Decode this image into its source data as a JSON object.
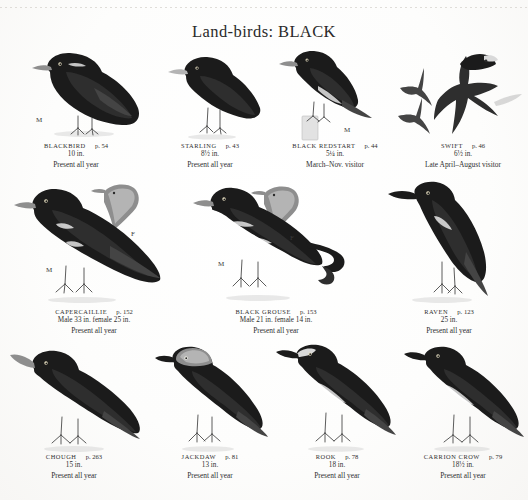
{
  "plate": {
    "title": "Land-birds: BLACK"
  },
  "rows": [
    {
      "entries": [
        {
          "name": "BLACKBIRD",
          "page": "p. 54",
          "size": "10 in.",
          "status": "Present all year",
          "icon": "blackbird-illustration",
          "sex_labels": [
            "M"
          ]
        },
        {
          "name": "STARLING",
          "page": "p. 43",
          "size": "8½ in.",
          "status": "Present all year",
          "icon": "starling-illustration",
          "sex_labels": []
        },
        {
          "name": "BLACK REDSTART",
          "page": "p. 44",
          "size": "5¼ in.",
          "status": "March–Nov. visitor",
          "icon": "black-redstart-illustration",
          "sex_labels": [
            "M"
          ]
        },
        {
          "name": "SWIFT",
          "page": "p. 46",
          "size": "6½ in.",
          "status": "Late April–August visitor",
          "icon": "swift-illustration",
          "sex_labels": []
        }
      ]
    },
    {
      "entries": [
        {
          "name": "CAPERCAILLIE",
          "page": "p. 152",
          "size": "Male 33 in. female 25 in.",
          "status": "Present all year",
          "icon": "capercaillie-illustration",
          "sex_labels": [
            "M",
            "F"
          ]
        },
        {
          "name": "BLACK GROUSE",
          "page": "p. 153",
          "size": "Male 21 in. female 14 in.",
          "status": "Present all year",
          "icon": "black-grouse-illustration",
          "sex_labels": [
            "M",
            "F"
          ]
        },
        {
          "name": "RAVEN",
          "page": "p. 123",
          "size": "25 in.",
          "status": "Present all year",
          "icon": "raven-illustration",
          "sex_labels": []
        }
      ]
    },
    {
      "entries": [
        {
          "name": "CHOUGH",
          "page": "p. 263",
          "size": "15 in.",
          "status": "Present all year",
          "icon": "chough-illustration",
          "sex_labels": []
        },
        {
          "name": "JACKDAW",
          "page": "p. 81",
          "size": "13 in.",
          "status": "Present all year",
          "icon": "jackdaw-illustration",
          "sex_labels": []
        },
        {
          "name": "ROOK",
          "page": "p. 78",
          "size": "18 in.",
          "status": "Present all year",
          "icon": "rook-illustration",
          "sex_labels": []
        },
        {
          "name": "CARRION CROW",
          "page": "p. 79",
          "size": "18½ in.",
          "status": "Present all year",
          "icon": "carrion-crow-illustration",
          "sex_labels": []
        }
      ]
    }
  ],
  "colors": {
    "ink": "#1b1b1b",
    "paper": "#ffffff",
    "text": "#2f2f2f",
    "grey": "#8e8e8e"
  }
}
